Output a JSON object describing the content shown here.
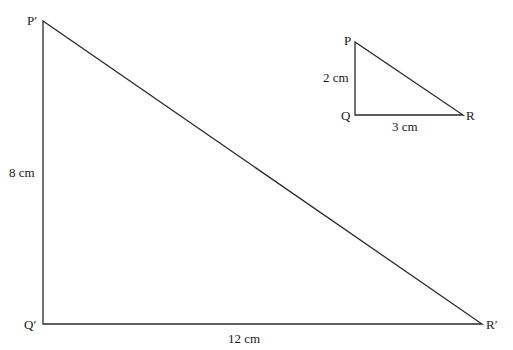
{
  "diagram": {
    "large_triangle": {
      "vertices": {
        "P": "P′",
        "Q": "Q′",
        "R": "R′"
      },
      "sides": {
        "vertical": "8 cm",
        "horizontal": "12 cm"
      },
      "points": {
        "P": [
          43,
          21
        ],
        "Q": [
          43,
          324
        ],
        "R": [
          482,
          324
        ]
      }
    },
    "small_triangle": {
      "vertices": {
        "P": "P",
        "Q": "Q",
        "R": "R"
      },
      "sides": {
        "vertical": "2 cm",
        "horizontal": "3 cm"
      },
      "points": {
        "P": [
          355,
          42
        ],
        "Q": [
          355,
          115
        ],
        "R": [
          463,
          115
        ]
      }
    }
  }
}
